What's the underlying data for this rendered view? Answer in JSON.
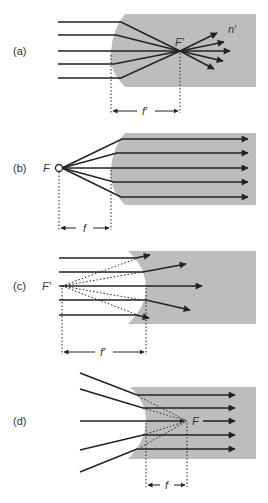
{
  "figure": {
    "colors": {
      "medium": "#bdbdbd",
      "ray": "#222222",
      "label": "#333333",
      "background": "#ffffff"
    },
    "panels": [
      {
        "id": "a",
        "label": "(a)",
        "surface": "convex",
        "focus_label": "F′",
        "index_label": "n′",
        "distance_label": "f′",
        "description": "Parallel rays incident on convex surface converge to focal point F′ inside the medium"
      },
      {
        "id": "b",
        "label": "(b)",
        "surface": "convex",
        "focus_label": "F",
        "distance_label": "f",
        "description": "Rays from focal point F in air become parallel inside the medium"
      },
      {
        "id": "c",
        "label": "(c)",
        "surface": "concave",
        "focus_label": "F′",
        "distance_label": "f′",
        "description": "Parallel rays diverge at concave surface; virtual focal point F′ in front of surface"
      },
      {
        "id": "d",
        "label": "(d)",
        "surface": "concave",
        "focus_label": "F",
        "distance_label": "f",
        "description": "Rays converging toward F inside medium become parallel after concave surface"
      }
    ]
  }
}
